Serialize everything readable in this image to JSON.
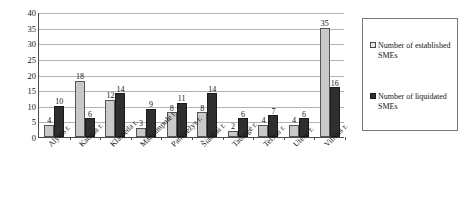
{
  "chart_data": {
    "type": "bar",
    "title": "",
    "subtitle": "",
    "xlabel": "",
    "ylabel": "",
    "ylim": [
      0,
      40
    ],
    "ytick_step": 5,
    "yticks": [
      0,
      5,
      10,
      15,
      20,
      25,
      30,
      35,
      40
    ],
    "grid": true,
    "legend_position": "right",
    "categories": [
      "Alytus r.",
      "Kaunas r.",
      "Klaipėda r.",
      "Marijampolė r.",
      "Panevėžys r.",
      "Šiauliai r.",
      "Tauragė r.",
      "Telšiai r.",
      "Utena r.",
      "Vilnius r."
    ],
    "series": [
      {
        "name": "Number of established SMEs",
        "color": "#c9c9c9",
        "values": [
          4,
          18,
          12,
          3,
          8,
          8,
          2,
          4,
          4,
          35
        ]
      },
      {
        "name": "Number of liquidated SMEs",
        "color": "#2f2f2f",
        "values": [
          10,
          6,
          14,
          9,
          11,
          14,
          6,
          7,
          6,
          16
        ]
      }
    ]
  },
  "legend": {
    "items": [
      {
        "label": "Number of established SMEs",
        "swatch": "established"
      },
      {
        "label": "Number of liquidated SMEs",
        "swatch": "liquidated"
      }
    ]
  }
}
